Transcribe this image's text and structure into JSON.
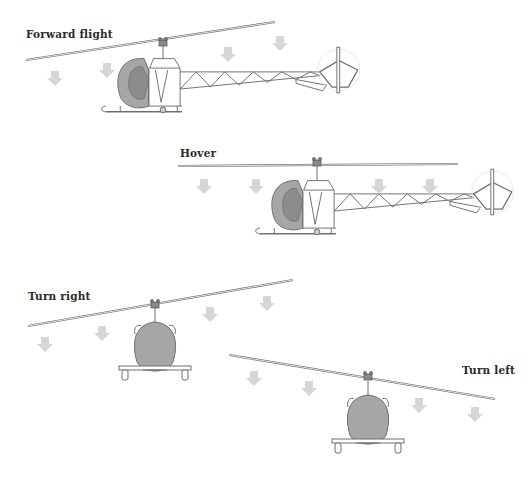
{
  "figure": {
    "colors": {
      "background": "#ffffff",
      "line": "#6e6e6e",
      "canopy_fill": "#a6a6a6",
      "canopy_inner": "#8c8c8c",
      "arrow_fill": "#d6d6d6",
      "label": "#2a2a2a"
    },
    "panels": [
      {
        "id": "forward-flight",
        "label": "Forward flight",
        "view": "side",
        "rotor_tilt": "forward",
        "downwash_arrows": 6
      },
      {
        "id": "hover",
        "label": "Hover",
        "view": "side",
        "rotor_tilt": "level",
        "downwash_arrows": 6
      },
      {
        "id": "turn-right",
        "label": "Turn right",
        "view": "front",
        "rotor_tilt": "right",
        "downwash_arrows": 6
      },
      {
        "id": "turn-left",
        "label": "Turn left",
        "view": "front",
        "rotor_tilt": "left",
        "downwash_arrows": 6
      }
    ]
  }
}
